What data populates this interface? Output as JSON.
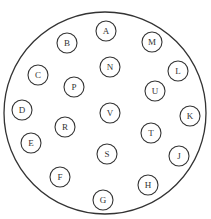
{
  "diagram": {
    "type": "circle-layout",
    "stroke_color": "#333333",
    "background": "#ffffff",
    "outer_circle": {
      "cx": 105,
      "cy": 113,
      "r": 101
    },
    "node_radius": 10,
    "nodes": [
      {
        "id": "A",
        "label": "A",
        "cx": 106,
        "cy": 31
      },
      {
        "id": "B",
        "label": "B",
        "cx": 67,
        "cy": 43
      },
      {
        "id": "M",
        "label": "M",
        "cx": 152,
        "cy": 42
      },
      {
        "id": "N",
        "label": "N",
        "cx": 110,
        "cy": 67
      },
      {
        "id": "C",
        "label": "C",
        "cx": 38,
        "cy": 75
      },
      {
        "id": "L",
        "label": "L",
        "cx": 178,
        "cy": 71
      },
      {
        "id": "P",
        "label": "P",
        "cx": 74,
        "cy": 87
      },
      {
        "id": "U",
        "label": "U",
        "cx": 155,
        "cy": 91
      },
      {
        "id": "D",
        "label": "D",
        "cx": 22,
        "cy": 110
      },
      {
        "id": "V",
        "label": "V",
        "cx": 110,
        "cy": 113
      },
      {
        "id": "K",
        "label": "K",
        "cx": 190,
        "cy": 116
      },
      {
        "id": "R",
        "label": "R",
        "cx": 65,
        "cy": 127
      },
      {
        "id": "T",
        "label": "T",
        "cx": 151,
        "cy": 133
      },
      {
        "id": "E",
        "label": "E",
        "cx": 31,
        "cy": 143
      },
      {
        "id": "S",
        "label": "S",
        "cx": 107,
        "cy": 154
      },
      {
        "id": "J",
        "label": "J",
        "cx": 179,
        "cy": 156
      },
      {
        "id": "F",
        "label": "F",
        "cx": 60,
        "cy": 177
      },
      {
        "id": "H",
        "label": "H",
        "cx": 148,
        "cy": 185
      },
      {
        "id": "G",
        "label": "G",
        "cx": 103,
        "cy": 200
      }
    ]
  }
}
